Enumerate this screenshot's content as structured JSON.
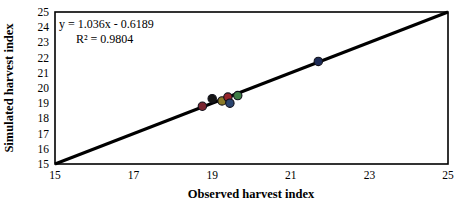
{
  "chart_data": {
    "type": "scatter",
    "title": "",
    "xlabel": "Observed harvest index",
    "ylabel": "Simulated harvest index",
    "xlim": [
      15,
      25
    ],
    "ylim": [
      15,
      25
    ],
    "x_ticks": [
      15,
      17,
      19,
      21,
      23,
      25
    ],
    "y_ticks": [
      15,
      16,
      17,
      18,
      19,
      20,
      21,
      22,
      23,
      24,
      25
    ],
    "grid": false,
    "legend_position": "none",
    "annotation": {
      "equation": "y = 1.036x - 0.6189",
      "r_squared": "R² = 0.9804"
    },
    "one_to_one_line": {
      "x": [
        15,
        25
      ],
      "y": [
        15,
        25
      ],
      "color": "#000000",
      "width": 3
    },
    "frame_color": "#000000",
    "marker_stroke_color": "#10101a",
    "points": [
      {
        "name": "maroon",
        "x": 18.75,
        "y": 18.8,
        "color": "#7a2430"
      },
      {
        "name": "black",
        "x": 19.0,
        "y": 19.3,
        "color": "#141414"
      },
      {
        "name": "olive",
        "x": 19.25,
        "y": 19.15,
        "color": "#8a7a28"
      },
      {
        "name": "dark-red",
        "x": 19.4,
        "y": 19.4,
        "color": "#96242a"
      },
      {
        "name": "blue",
        "x": 19.45,
        "y": 19.0,
        "color": "#2b4570"
      },
      {
        "name": "green",
        "x": 19.65,
        "y": 19.5,
        "color": "#3e7d46"
      },
      {
        "name": "navy",
        "x": 21.7,
        "y": 21.75,
        "color": "#1d2b55"
      }
    ]
  }
}
